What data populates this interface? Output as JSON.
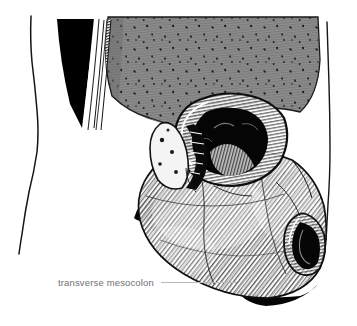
{
  "figure": {
    "kind": "anatomical-line-illustration",
    "title_text": "",
    "background_color": "#ffffff",
    "ink_color": "#111111",
    "omentum_fill_color": "#8d8d8d",
    "shadow_color": "#000000",
    "label_text_color": "#6f6f6f",
    "leader_line_color": "#b9b9b9",
    "cropped_top_text": "transverse colon greater omentum"
  },
  "annotations": [
    {
      "id": "transverse-mesocolon",
      "label": "transverse mesocolon",
      "leader_length_px": 76,
      "x_px": 58,
      "y_px": 277
    }
  ],
  "structures": [
    {
      "name": "body-wall-outline-left",
      "kind": "contour"
    },
    {
      "name": "body-wall-outline-right",
      "kind": "contour"
    },
    {
      "name": "greater-omentum",
      "kind": "stippled-sheet"
    },
    {
      "name": "omentum-cut-edge",
      "kind": "layered-band"
    },
    {
      "name": "transverse-colon-lumen",
      "kind": "opened-lumen"
    },
    {
      "name": "small-bowel-loops",
      "kind": "hatched-mass"
    },
    {
      "name": "jejunum-cut-end",
      "kind": "opened-lumen"
    },
    {
      "name": "mesentery-shadow",
      "kind": "solid-black-wedge"
    }
  ]
}
